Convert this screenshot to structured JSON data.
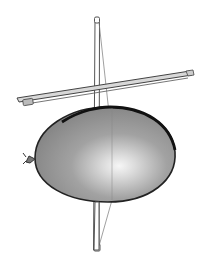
{
  "scene": {
    "description": "Illustration of a gray balloon pierced by a vertical bow and a horizontal bow",
    "background": "#ffffff",
    "balloon_color": "#8e8e8e",
    "balloon_highlight": "#f4f4f4",
    "outline_color": "#222222",
    "bow_color": "#555555"
  }
}
